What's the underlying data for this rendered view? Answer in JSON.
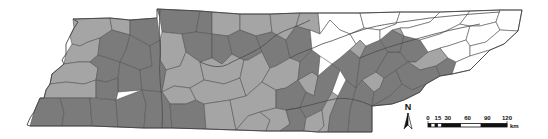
{
  "map": {
    "colors": {
      "light": "#a8a8a8",
      "dark": "#7d7d7d",
      "none": "#ffffff",
      "border": "#555555"
    },
    "regions": [
      {
        "id": "w1",
        "fill": "light",
        "points": "73,19 110,18 112,30 100,38 88,42 80,46 72,44 70,36 74,28"
      },
      {
        "id": "w2",
        "fill": "light",
        "points": "110,18 130,20 130,35 112,30"
      },
      {
        "id": "w3",
        "fill": "dark",
        "points": "130,20 157,18 160,40 150,46 130,35"
      },
      {
        "id": "w4",
        "fill": "light",
        "points": "72,44 80,46 88,42 100,38 98,55 90,62 78,62 64,64 66,54"
      },
      {
        "id": "w5",
        "fill": "dark",
        "points": "100,38 112,30 130,35 126,50 120,62 98,55"
      },
      {
        "id": "w6",
        "fill": "dark",
        "points": "130,35 150,46 152,66 140,70 120,62 126,50"
      },
      {
        "id": "w7",
        "fill": "light",
        "points": "64,64 78,62 90,62 98,68 96,80 84,84 66,82 50,84 52,74"
      },
      {
        "id": "w8",
        "fill": "dark",
        "points": "98,55 120,62 118,78 106,82 96,80 98,68 90,62"
      },
      {
        "id": "w9",
        "fill": "dark",
        "points": "120,62 140,70 142,90 118,92 118,78"
      },
      {
        "id": "w10",
        "fill": "light",
        "points": "50,84 66,82 84,84 96,80 96,98 80,98 60,98 44,98 46,90"
      },
      {
        "id": "w11",
        "fill": "dark",
        "points": "96,80 106,82 118,78 118,92 116,100 96,98"
      },
      {
        "id": "w12",
        "fill": "dark",
        "points": "40,98 60,98 64,112 62,126 30,126 34,112"
      },
      {
        "id": "w13",
        "fill": "dark",
        "points": "60,98 90,98 92,126 62,126 64,112"
      },
      {
        "id": "w14",
        "fill": "dark",
        "points": "90,98 116,100 118,127 92,126"
      },
      {
        "id": "w15",
        "fill": "dark",
        "points": "116,100 142,90 146,104 144,128 118,127"
      },
      {
        "id": "m1",
        "fill": "dark",
        "points": "157,9 200,11 196,32 182,34 162,32 160,18"
      },
      {
        "id": "m2",
        "fill": "dark",
        "points": "200,11 212,12 212,34 196,32"
      },
      {
        "id": "m3",
        "fill": "light",
        "points": "162,32 182,34 186,52 180,66 166,70 160,60 160,40"
      },
      {
        "id": "m4",
        "fill": "dark",
        "points": "182,34 196,32 212,34 212,58 200,62 186,52"
      },
      {
        "id": "m5",
        "fill": "dark",
        "points": "150,46 160,40 160,60 166,70 162,92 142,90 140,70 152,66"
      },
      {
        "id": "m6",
        "fill": "light",
        "points": "166,70 180,66 186,52 200,62 204,80 190,88 174,86 162,92"
      },
      {
        "id": "m7",
        "fill": "light",
        "points": "162,92 174,86 190,88 196,100 186,104 170,104"
      },
      {
        "id": "m8",
        "fill": "dark",
        "points": "142,90 162,92 170,104 172,128 144,128 146,104"
      },
      {
        "id": "m9",
        "fill": "dark",
        "points": "170,104 186,104 196,100 204,104 206,129 172,128"
      },
      {
        "id": "m10",
        "fill": "light",
        "points": "212,12 240,14 240,30 228,36 212,34"
      },
      {
        "id": "m11",
        "fill": "light",
        "points": "240,14 270,14 272,32 256,36 240,30"
      },
      {
        "id": "m12",
        "fill": "dark",
        "points": "212,34 228,36 232,54 222,64 212,58"
      },
      {
        "id": "m13",
        "fill": "light",
        "points": "200,62 212,58 222,64 232,54 244,60 240,78 224,84 204,80"
      },
      {
        "id": "m14",
        "fill": "light",
        "points": "204,80 224,84 240,78 246,96 230,100 204,104 196,100 190,88"
      },
      {
        "id": "m15",
        "fill": "light",
        "points": "204,104 230,100 236,130 206,129"
      },
      {
        "id": "m16",
        "fill": "dark",
        "points": "228,36 240,30 256,36 262,52 248,60 244,60 232,54"
      },
      {
        "id": "m17",
        "fill": "light",
        "points": "244,60 248,60 262,52 270,68 262,82 246,96 240,78"
      },
      {
        "id": "m18",
        "fill": "light",
        "points": "246,96 262,82 276,90 276,108 260,112 248,116 236,130 230,100"
      },
      {
        "id": "m19",
        "fill": "light",
        "points": "236,130 248,116 260,112 270,120 266,131"
      },
      {
        "id": "m20",
        "fill": "dark",
        "points": "256,36 272,32 286,40 290,58 276,66 270,68 262,52"
      },
      {
        "id": "m21",
        "fill": "light",
        "points": "272,32 270,14 300,13 296,26 286,40"
      },
      {
        "id": "m22",
        "fill": "dark",
        "points": "286,40 296,26 310,30 312,50 300,62 290,58"
      },
      {
        "id": "m23",
        "fill": "light",
        "points": "270,68 276,66 290,58 300,62 298,80 286,88 276,90 262,82"
      },
      {
        "id": "m24",
        "fill": "dark",
        "points": "276,90 286,88 298,80 306,92 300,108 286,110 276,108"
      },
      {
        "id": "m25",
        "fill": "light",
        "points": "260,112 276,108 286,110 290,124 280,131 266,131 270,120"
      },
      {
        "id": "m26",
        "fill": "dark",
        "points": "286,110 300,108 306,118 304,131 280,131 290,124"
      },
      {
        "id": "m27",
        "fill": "light",
        "points": "298,80 312,72 318,76 314,96 306,92"
      },
      {
        "id": "m28",
        "fill": "dark",
        "points": "300,62 312,50 320,56 318,76 312,72 298,80"
      },
      {
        "id": "m29",
        "fill": "light",
        "points": "300,13 318,13 320,34 310,30 296,26"
      },
      {
        "id": "e1",
        "fill": "dark",
        "points": "306,92 314,96 318,76 332,64 340,70 332,92 322,110 306,118 300,108"
      },
      {
        "id": "e2",
        "fill": "light",
        "points": "306,118 322,110 324,126 318,132 304,131"
      },
      {
        "id": "e3",
        "fill": "light",
        "points": "324,126 322,110 332,92 338,96 330,116 328,132 318,132"
      },
      {
        "id": "e4",
        "fill": "dark",
        "points": "328,132 330,116 338,96 346,80 356,88 350,110 348,132"
      },
      {
        "id": "e5",
        "fill": "dark",
        "points": "332,64 350,50 360,58 356,88 346,80 340,70"
      },
      {
        "id": "e6",
        "fill": "light",
        "points": "350,50 360,40 366,46 360,58"
      },
      {
        "id": "e7",
        "fill": "dark",
        "points": "360,58 366,46 380,40 388,52 376,72 362,80 356,88"
      },
      {
        "id": "e8",
        "fill": "dark",
        "points": "348,132 350,110 356,88 362,80 374,92 372,106 372,132"
      },
      {
        "id": "e9",
        "fill": "light",
        "points": "362,80 376,72 384,78 380,88 374,92"
      },
      {
        "id": "e10",
        "fill": "dark",
        "points": "374,92 380,88 384,78 396,70 402,84 390,96 372,106"
      },
      {
        "id": "e11",
        "fill": "dark",
        "points": "376,72 388,52 400,52 408,62 396,70 384,78"
      },
      {
        "id": "e12",
        "fill": "dark",
        "points": "380,40 392,30 404,36 400,52 388,52"
      },
      {
        "id": "e13",
        "fill": "light",
        "points": "392,30 400,28 404,36"
      },
      {
        "id": "e14",
        "fill": "dark",
        "points": "400,52 404,36 420,40 428,52 416,62 408,62"
      },
      {
        "id": "e15",
        "fill": "light",
        "points": "408,62 416,62 428,52 440,48 448,58 436,66 420,70"
      },
      {
        "id": "e16",
        "fill": "dark",
        "points": "396,70 408,62 420,70 436,66 440,76 426,84 412,90 402,84"
      },
      {
        "id": "e17",
        "fill": "dark",
        "points": "436,66 448,58 456,62 452,74 440,76"
      },
      {
        "id": "e18",
        "fill": "dark",
        "points": "390,96 402,84 412,90 426,84 420,92 404,100 392,104 372,106"
      },
      {
        "id": "e19",
        "fill": "none",
        "points": "318,13 360,13 364,28 350,34 340,30 330,20 320,34"
      },
      {
        "id": "e20",
        "fill": "none",
        "points": "320,34 330,20 340,30 350,34 356,44 340,58 332,64 320,56 312,50 310,30"
      },
      {
        "id": "e21",
        "fill": "none",
        "points": "360,13 400,12 396,24 380,30 364,28"
      },
      {
        "id": "e22",
        "fill": "none",
        "points": "350,34 364,28 380,30 380,40 366,46 360,40 356,44"
      },
      {
        "id": "e23",
        "fill": "none",
        "points": "380,30 396,24 400,12 440,12 430,22 408,28 400,28 392,30 380,40"
      },
      {
        "id": "e24",
        "fill": "none",
        "points": "408,28 430,22 440,12 470,11 460,24 440,34 420,40 404,36 400,28"
      },
      {
        "id": "e25",
        "fill": "none",
        "points": "420,40 440,34 460,24 470,26 466,40 448,46 440,48 428,52"
      },
      {
        "id": "e26",
        "fill": "none",
        "points": "470,11 500,10 496,22 480,26 470,26 460,24"
      },
      {
        "id": "e27",
        "fill": "none",
        "points": "470,26 480,26 496,22 500,30 486,42 470,46 466,40"
      },
      {
        "id": "e28",
        "fill": "none",
        "points": "440,48 448,46 466,40 470,46 470,56 456,62 448,58"
      },
      {
        "id": "e29",
        "fill": "none",
        "points": "500,10 522,10 518,31 500,30 496,22"
      },
      {
        "id": "e30",
        "fill": "none",
        "points": "486,42 500,30 518,31 504,44 490,50 470,56 470,46"
      },
      {
        "id": "e31",
        "fill": "none",
        "points": "456,62 470,56 490,50 470,70 452,74"
      }
    ],
    "outline": "73,19 78,22 74,28 70,36 66,44 66,54 62,60 64,64 52,74 50,84 46,90 44,98 40,98 34,112 30,118 27,125 30,126 62,126 92,126 118,127 144,128 172,128 206,129 236,130 266,131 304,131 318,132 348,132 372,132 372,106 392,104 404,100 420,92 426,84 440,76 452,74 470,70 490,50 504,44 518,31 522,10 500,10 470,11 440,12 400,12 360,13 318,13 300,13 270,14 240,14 212,12 200,11 157,9 157,18 130,20 110,18 73,19",
    "rivers": [
      "M 160,10 C 158,30 162,50 160,60 C 158,80 164,100 162,128",
      "M 200,62 C 210,66 220,70 232,62 C 244,56 260,50 270,40 C 280,30 296,28 310,20",
      "M 290,58 C 300,52 310,50 322,44 C 336,40 348,34 362,30 C 380,24 404,22 430,18 C 450,16 470,14 500,12",
      "M 372,106 C 360,100 344,96 330,100 C 314,104 300,108 286,110",
      "M 360,58 C 378,50 398,44 420,38 C 440,32 460,28 480,24"
    ]
  },
  "north_arrow": {
    "label": "N"
  },
  "scale_bar": {
    "ticks": [
      "0",
      "15",
      "30",
      "60",
      "90",
      "120"
    ],
    "unit": "km"
  }
}
